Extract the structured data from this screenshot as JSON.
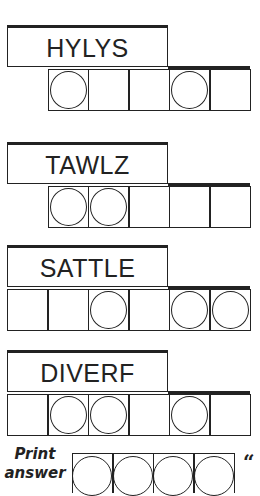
{
  "puzzles": [
    {
      "scrambled": "HYLYS",
      "label_top": 25,
      "cells_top": 69,
      "cell_indices": [
        1,
        2,
        3,
        4,
        5
      ],
      "circled": [
        1,
        4
      ]
    },
    {
      "scrambled": "TAWLZ",
      "label_top": 142,
      "cells_top": 186,
      "cell_indices": [
        1,
        2,
        3,
        4,
        5
      ],
      "circled": [
        1,
        2
      ]
    },
    {
      "scrambled": "SATTLE",
      "label_top": 245,
      "cells_top": 289,
      "cell_indices": [
        0,
        1,
        2,
        3,
        4,
        5
      ],
      "circled": [
        2,
        4,
        5
      ]
    },
    {
      "scrambled": "DIVERF",
      "label_top": 350,
      "cells_top": 394,
      "cell_indices": [
        0,
        1,
        2,
        3,
        4,
        5
      ],
      "circled": [
        1,
        2,
        4
      ]
    }
  ],
  "answer": {
    "label_line1": "Print",
    "label_line2": "answer",
    "cell_count": 4,
    "quote_mark": "“"
  },
  "colors": {
    "ink": "#222222",
    "background": "#ffffff"
  }
}
